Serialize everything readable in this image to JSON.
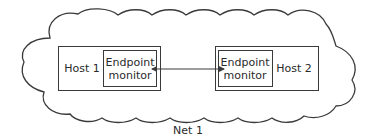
{
  "diagram": {
    "network": {
      "label": "Net 1",
      "shape": "cloud"
    },
    "hosts": [
      {
        "label": "Host 1",
        "monitor": {
          "line1": "Endpoint",
          "line2": "monitor"
        }
      },
      {
        "label": "Host 2",
        "monitor": {
          "line1": "Endpoint",
          "line2": "monitor"
        }
      }
    ],
    "connection": {
      "from": "Host 1 Endpoint monitor",
      "to": "Host 2 Endpoint monitor",
      "type": "bidirectional-arrow"
    },
    "colors": {
      "stroke": "#3a3a3a",
      "text": "#2a2a2a",
      "background": "#ffffff"
    }
  }
}
